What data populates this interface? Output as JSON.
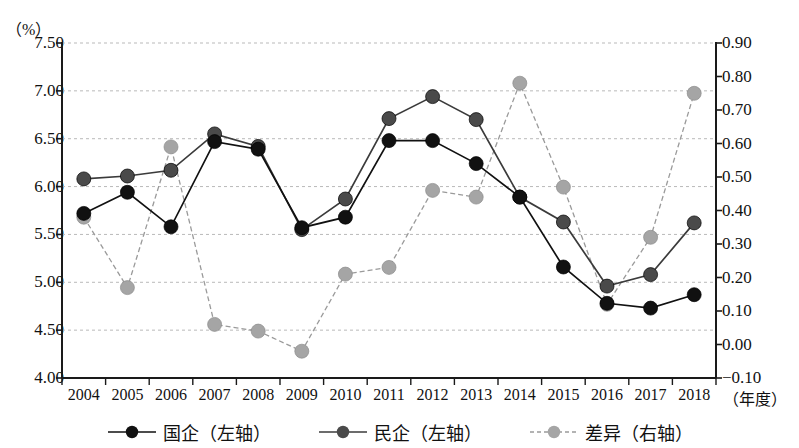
{
  "chart_data": {
    "type": "line",
    "title": "",
    "xlabel": "（年度）",
    "ylabel": "（%）",
    "y_left_unit": "（%）",
    "x_unit": "（年度）",
    "categories": [
      "2004",
      "2005",
      "2006",
      "2007",
      "2008",
      "2009",
      "2010",
      "2011",
      "2012",
      "2013",
      "2014",
      "2015",
      "2016",
      "2017",
      "2018"
    ],
    "y_left_ticks": [
      "4.00",
      "4.50",
      "5.00",
      "5.50",
      "6.00",
      "6.50",
      "7.00",
      "7.50"
    ],
    "y_right_ticks": [
      "-0.10",
      "0.00",
      "0.10",
      "0.20",
      "0.30",
      "0.40",
      "0.50",
      "0.60",
      "0.70",
      "0.80",
      "0.90"
    ],
    "ylim_left": [
      4.0,
      7.5
    ],
    "ylim_right": [
      -0.1,
      0.9
    ],
    "grid": true,
    "legend_position": "bottom",
    "series": [
      {
        "name": "国企（左轴）",
        "axis": "left",
        "color": "#111111",
        "line_style": "solid",
        "values": [
          5.72,
          5.94,
          5.58,
          6.47,
          6.39,
          5.57,
          5.68,
          6.48,
          6.48,
          6.24,
          5.89,
          5.16,
          4.78,
          4.73,
          4.87
        ]
      },
      {
        "name": "民企（左轴）",
        "axis": "left",
        "color": "#3b3b3b",
        "line_style": "solid",
        "values": [
          6.08,
          6.11,
          6.17,
          6.55,
          6.42,
          5.55,
          5.87,
          6.71,
          6.94,
          6.7,
          5.89,
          5.63,
          4.96,
          5.08,
          5.62
        ]
      },
      {
        "name": "差异（右轴）",
        "axis": "right",
        "color": "#9a9a9a",
        "line_style": "dashed",
        "values": [
          0.38,
          0.17,
          0.59,
          0.06,
          0.04,
          -0.02,
          0.21,
          0.23,
          0.46,
          0.44,
          0.78,
          0.47,
          0.12,
          0.32,
          0.75
        ]
      }
    ]
  },
  "legend": {
    "items": [
      {
        "label": "国企（左轴）",
        "marker": "filled-circle-black",
        "line": "solid"
      },
      {
        "label": "民企（左轴）",
        "marker": "filled-circle-darkgray",
        "line": "solid"
      },
      {
        "label": "差异（右轴）",
        "marker": "filled-circle-gray",
        "line": "dashed"
      }
    ]
  },
  "colors": {
    "series_guoqi": "#111111",
    "series_minqi": "#3b3b3b",
    "series_chayi": "#9a9a9a",
    "axis": "#1a1a1a",
    "grid": "#b9b9b9",
    "background": "#ffffff"
  }
}
